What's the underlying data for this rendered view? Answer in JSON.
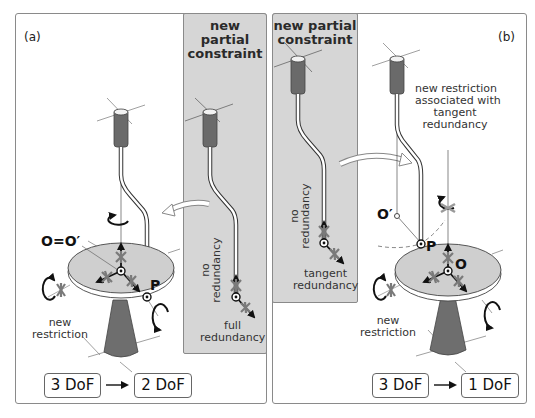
{
  "panel_a": {
    "tag": "(a)",
    "inset_title_line1": "new partial",
    "inset_title_line2": "constraint",
    "inset_label_no_redundancy_1": "no",
    "inset_label_no_redundancy_2": "redundancy",
    "inset_label_full_1": "full",
    "inset_label_full_2": "redundancy",
    "point_origin": "O=O′",
    "point_p": "P",
    "new_restriction_1": "new",
    "new_restriction_2": "restriction",
    "dof_from": "3 DoF",
    "dof_to": "2 DoF"
  },
  "panel_b": {
    "tag": "(b)",
    "inset_title_line1": "new partial",
    "inset_title_line2": "constraint",
    "inset_label_no_redundancy_1": "no",
    "inset_label_no_redundancy_2": "redundancy",
    "inset_label_tangent_1": "tangent",
    "inset_label_tangent_2": "redundancy",
    "assoc_line1": "new restriction",
    "assoc_line2": "associated with",
    "assoc_line3": "tangent",
    "assoc_line4": "redundancy",
    "point_o_prime": "O′",
    "point_p": "P",
    "point_o": "O",
    "new_restriction_1": "new",
    "new_restriction_2": "restriction",
    "dof_from": "3 DoF",
    "dof_to": "1 DoF"
  },
  "colors": {
    "inset_gray": "#d6d6d6",
    "disc_fill": "#cfcfcf",
    "pedestal_fill": "#6e6e6e",
    "handle_fill": "#6a6a6a",
    "asterisk": "#7a7a7a",
    "arrow": "#111111"
  }
}
